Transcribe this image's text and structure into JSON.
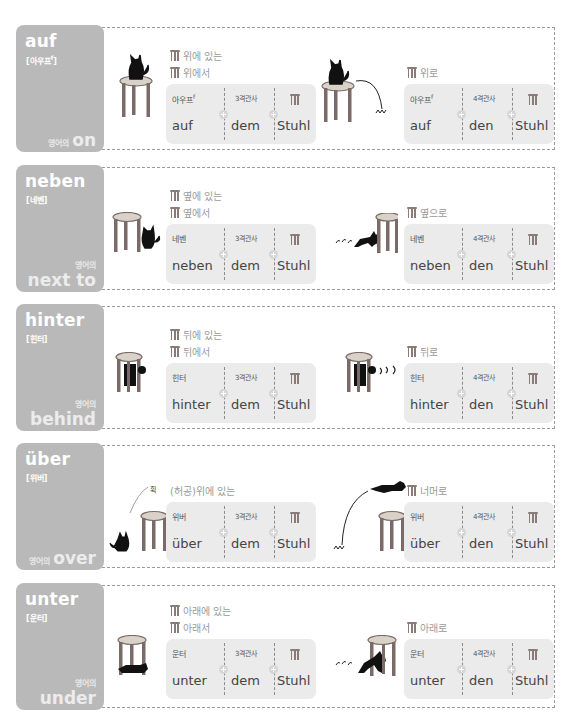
{
  "rows": [
    {
      "word": "auf",
      "pron": "아우프",
      "pron_sup": "f",
      "eng_pre": "영어의",
      "eng": "on",
      "static_labels": [
        "위에 있는",
        "위에서"
      ],
      "motion_label": "위로",
      "static_box": {
        "c1_top": "아우프",
        "c1_sup": "f",
        "c1_bot": "auf",
        "c2_top": "3격관사",
        "c2_bot": "dem",
        "c3_bot": "Stuhl"
      },
      "motion_box": {
        "c1_top": "아우프",
        "c1_sup": "f",
        "c1_bot": "auf",
        "c2_top": "4격관사",
        "c2_bot": "den",
        "c3_bot": "Stuhl"
      }
    },
    {
      "word": "neben",
      "pron": "네벤",
      "pron_sup": "",
      "eng_pre": "영어의",
      "eng": "next to",
      "static_labels": [
        "옆에 있는",
        "옆에서"
      ],
      "motion_label": "옆으로",
      "static_box": {
        "c1_top": "네벤",
        "c1_sup": "",
        "c1_bot": "neben",
        "c2_top": "3격관사",
        "c2_bot": "dem",
        "c3_bot": "Stuhl"
      },
      "motion_box": {
        "c1_top": "네벤",
        "c1_sup": "",
        "c1_bot": "neben",
        "c2_top": "4격관사",
        "c2_bot": "den",
        "c3_bot": "Stuhl"
      }
    },
    {
      "word": "hinter",
      "pron": "힌터",
      "pron_sup": "",
      "eng_pre": "영어의",
      "eng": "behind",
      "static_labels": [
        "뒤에 있는",
        "뒤에서"
      ],
      "motion_label": "뒤로",
      "static_box": {
        "c1_top": "힌터",
        "c1_sup": "",
        "c1_bot": "hinter",
        "c2_top": "3격관사",
        "c2_bot": "dem",
        "c3_bot": "Stuhl"
      },
      "motion_box": {
        "c1_top": "힌터",
        "c1_sup": "",
        "c1_bot": "hinter",
        "c2_top": "4격관사",
        "c2_bot": "den",
        "c3_bot": "Stuhl"
      }
    },
    {
      "word": "über",
      "pron": "위버",
      "pron_sup": "",
      "eng_pre": "영어의",
      "eng": "over",
      "static_labels": [
        "(허공)위에 있는"
      ],
      "sound_effect": "휙",
      "motion_label": "너머로",
      "static_box": {
        "c1_top": "위버",
        "c1_sup": "",
        "c1_bot": "über",
        "c2_top": "3격관사",
        "c2_bot": "dem",
        "c3_bot": "Stuhl"
      },
      "motion_box": {
        "c1_top": "위버",
        "c1_sup": "",
        "c1_bot": "über",
        "c2_top": "4격관사",
        "c2_bot": "den",
        "c3_bot": "Stuhl"
      }
    },
    {
      "word": "unter",
      "pron": "운터",
      "pron_sup": "",
      "eng_pre": "영어의",
      "eng": "under",
      "static_labels": [
        "아래에 있는",
        "아래서"
      ],
      "motion_label": "아래로",
      "static_box": {
        "c1_top": "운터",
        "c1_sup": "",
        "c1_bot": "unter",
        "c2_top": "3격관사",
        "c2_bot": "dem",
        "c3_bot": "Stuhl"
      },
      "motion_box": {
        "c1_top": "운터",
        "c1_sup": "",
        "c1_bot": "unter",
        "c2_top": "4격관사",
        "c2_bot": "den",
        "c3_bot": "Stuhl"
      }
    }
  ],
  "colors": {
    "tab_bg": "#b9b9b9",
    "box_bg": "#ebebeb",
    "label": "#9a9a9a",
    "stool": "#8a7a78",
    "cat": "#111111"
  }
}
